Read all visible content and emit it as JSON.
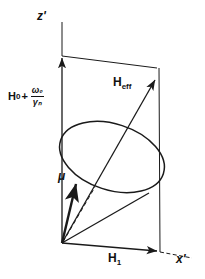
{
  "figure": {
    "type": "vector-diagram",
    "background_color": "#ffffff",
    "line_color": "#1a1a1a"
  },
  "axes": {
    "z_axis_label": "z'",
    "x_axis_label": "x'",
    "origin": {
      "x": 62,
      "y": 243
    }
  },
  "vectors": [
    {
      "name": "longitudinal-field-vector",
      "label_text": "H",
      "label_subscript": "0",
      "label_operator": "+",
      "label_fraction_numerator": "ω₀",
      "label_fraction_denominator": "γₙ",
      "from": {
        "x": 62,
        "y": 243
      },
      "to": {
        "x": 62,
        "y": 56
      }
    },
    {
      "name": "rf-field-vector",
      "label_text": "H",
      "label_subscript": "1",
      "from": {
        "x": 62,
        "y": 243
      },
      "to": {
        "x": 160,
        "y": 252
      }
    },
    {
      "name": "effective-field-vector",
      "label_text": "H",
      "label_subscript": "eff",
      "from": {
        "x": 62,
        "y": 243
      },
      "to": {
        "x": 157,
        "y": 77
      }
    },
    {
      "name": "magnetic-moment-vector",
      "label_text": "μ",
      "from": {
        "x": 62,
        "y": 243
      },
      "to": {
        "x": 77,
        "y": 181
      }
    }
  ],
  "labels": {
    "z_prime": "z'",
    "x_prime": "x'",
    "h_eff_base": "H",
    "h_eff_sub": "eff",
    "h_one_base": "H",
    "h_one_sub": "1",
    "h_zero_base": "H",
    "h_zero_sub": "0",
    "plus_sign": "+",
    "omega_zero": "ω₀",
    "gamma_n": "γₙ",
    "mu": "μ"
  },
  "precession_cone": {
    "name": "precession-ellipse",
    "center": {
      "x": 112,
      "y": 157
    },
    "radius_x": 54,
    "radius_y": 33,
    "rotation_deg": 18
  }
}
